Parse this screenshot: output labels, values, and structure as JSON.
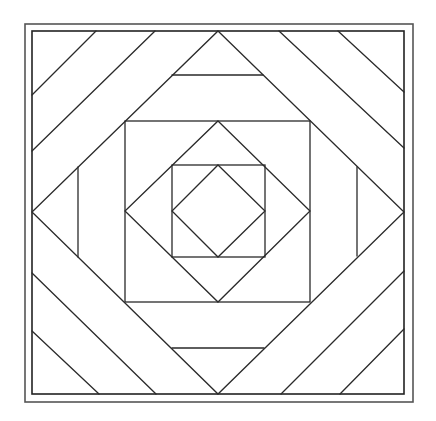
{
  "diagram": {
    "type": "quilt-block-line-drawing",
    "width": 436,
    "height": 421,
    "colors": {
      "background": "#ffffff",
      "stroke": "#2a2a2a",
      "frame_outer": "#555555",
      "frame_inner": "#222222"
    },
    "frames": {
      "outer": {
        "x": 25,
        "y": 24,
        "w": 388,
        "h": 378
      },
      "inner": {
        "x": 32,
        "y": 31,
        "w": 372,
        "h": 363
      }
    },
    "squares": {
      "middle": {
        "x": 125,
        "y": 121,
        "w": 185,
        "h": 181
      },
      "inner": {
        "x": 172,
        "y": 165,
        "w": 93,
        "h": 92
      }
    },
    "diamonds": {
      "outer": "218,31 404,212 218,394 32,212",
      "middle": "218,121 310,211 218,302 125,211",
      "inner": "218,165 265,211 218,257 172,211"
    },
    "bars": [
      {
        "name": "top-bar",
        "x1": 172,
        "y1": 75,
        "x2": 263,
        "y2": 75
      },
      {
        "name": "bottom-bar",
        "x1": 172,
        "y1": 348,
        "x2": 264,
        "y2": 348
      },
      {
        "name": "left-bar",
        "x1": 78,
        "y1": 167,
        "x2": 78,
        "y2": 257
      },
      {
        "name": "right-bar",
        "x1": 357,
        "y1": 167,
        "x2": 357,
        "y2": 256
      }
    ],
    "corner_stripes": [
      {
        "name": "tl-stripe-1",
        "x1": 96,
        "y1": 31,
        "x2": 32,
        "y2": 95
      },
      {
        "name": "tl-stripe-2",
        "x1": 155,
        "y1": 31,
        "x2": 32,
        "y2": 151
      },
      {
        "name": "tr-stripe-1",
        "x1": 338,
        "y1": 31,
        "x2": 404,
        "y2": 92
      },
      {
        "name": "tr-stripe-2",
        "x1": 279,
        "y1": 31,
        "x2": 404,
        "y2": 148
      },
      {
        "name": "bl-stripe-1",
        "x1": 32,
        "y1": 331,
        "x2": 99,
        "y2": 394
      },
      {
        "name": "bl-stripe-2",
        "x1": 32,
        "y1": 273,
        "x2": 156,
        "y2": 394
      },
      {
        "name": "br-stripe-1",
        "x1": 340,
        "y1": 394,
        "x2": 404,
        "y2": 329
      },
      {
        "name": "br-stripe-2",
        "x1": 281,
        "y1": 394,
        "x2": 404,
        "y2": 271
      }
    ]
  }
}
